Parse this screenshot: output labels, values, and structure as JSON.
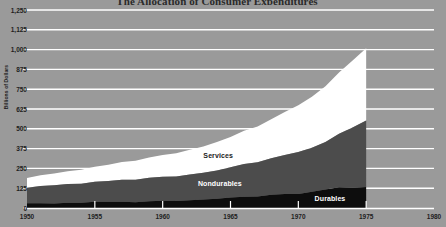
{
  "title": "The Allocation of Consumer Expenditures",
  "colors": {
    "background": "#9a9a9a",
    "plot_background": "#9a9a9a",
    "gridline": "#ffffff",
    "axis": "#ffffff",
    "services": "#ffffff",
    "nondurables": "#4c4c4c",
    "durables": "#0d0d0d",
    "text": "#1d1d1d"
  },
  "axes": {
    "ylabel": "Billions of Dollars",
    "yticks": [
      "0",
      "125",
      "250",
      "375",
      "500",
      "625",
      "750",
      "875",
      "1,000",
      "1,125",
      "1,250"
    ],
    "ytick_values": [
      0,
      125,
      250,
      375,
      500,
      625,
      750,
      875,
      1000,
      1125,
      1250
    ],
    "xticks": [
      "1950",
      "1955",
      "1960",
      "1965",
      "1970",
      "1975",
      "1980"
    ],
    "xtick_values": [
      1950,
      1955,
      1960,
      1965,
      1970,
      1975,
      1980
    ],
    "xlim": [
      1950,
      1980
    ],
    "ylim": [
      0,
      1250
    ]
  },
  "series_labels": {
    "services": "Services",
    "nondurables": "Nondurables",
    "durables": "Durables"
  },
  "chart_data": {
    "type": "area",
    "stacked": true,
    "title": "The Allocation of Consumer Expenditures",
    "xlabel": "",
    "ylabel": "Billions of Dollars",
    "xlim": [
      1950,
      1980
    ],
    "ylim": [
      0,
      1250
    ],
    "grid": true,
    "legend": "inline-labels",
    "x": [
      1950,
      1951,
      1952,
      1953,
      1954,
      1955,
      1956,
      1957,
      1958,
      1959,
      1960,
      1961,
      1962,
      1963,
      1964,
      1965,
      1966,
      1967,
      1968,
      1969,
      1970,
      1971,
      1972,
      1973,
      1974,
      1975
    ],
    "categories": [
      "1950",
      "1951",
      "1952",
      "1953",
      "1954",
      "1955",
      "1956",
      "1957",
      "1958",
      "1959",
      "1960",
      "1961",
      "1962",
      "1963",
      "1964",
      "1965",
      "1966",
      "1967",
      "1968",
      "1969",
      "1970",
      "1971",
      "1972",
      "1973",
      "1974",
      "1975"
    ],
    "series": [
      {
        "name": "Durables",
        "color": "#0d0d0d",
        "values": [
          30,
          30,
          29,
          33,
          33,
          39,
          39,
          40,
          37,
          43,
          45,
          44,
          49,
          54,
          59,
          66,
          71,
          73,
          83,
          89,
          89,
          103,
          117,
          131,
          128,
          133
        ]
      },
      {
        "name": "Nondurables",
        "color": "#4c4c4c",
        "values": [
          98,
          109,
          115,
          118,
          120,
          127,
          132,
          139,
          142,
          148,
          152,
          155,
          162,
          168,
          178,
          191,
          207,
          216,
          231,
          246,
          265,
          278,
          300,
          338,
          380,
          420
        ]
      },
      {
        "name": "Services",
        "color": "#ffffff",
        "values": [
          62,
          68,
          74,
          81,
          88,
          95,
          102,
          111,
          119,
          128,
          138,
          146,
          156,
          166,
          179,
          192,
          209,
          226,
          247,
          271,
          295,
          322,
          352,
          387,
          423,
          455
        ]
      }
    ],
    "totals": [
      190,
      207,
      218,
      232,
      241,
      261,
      273,
      290,
      298,
      319,
      335,
      345,
      367,
      388,
      416,
      449,
      487,
      515,
      561,
      606,
      649,
      703,
      769,
      856,
      931,
      1008
    ]
  }
}
